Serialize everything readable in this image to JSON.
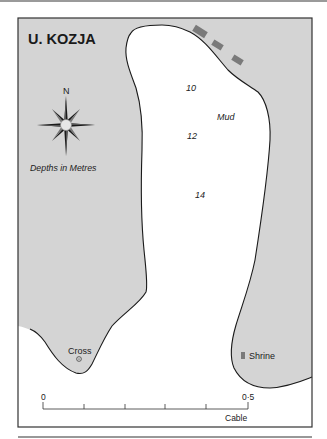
{
  "map": {
    "title": "U. KOZJA",
    "compass": {
      "north_label": "N"
    },
    "depth_note": "Depths in Metres",
    "soundings": [
      {
        "value": "10",
        "x": 186,
        "y": 91
      },
      {
        "value": "12",
        "x": 187,
        "y": 139
      },
      {
        "value": "14",
        "x": 195,
        "y": 198
      }
    ],
    "seabed": {
      "label": "Mud",
      "x": 217,
      "y": 120
    },
    "landmarks": [
      {
        "name": "Cross",
        "symbol": "⊙"
      },
      {
        "name": "Shrine"
      }
    ],
    "scale_bar": {
      "start_label": "0",
      "end_label": "0·5",
      "unit": "Cable",
      "ticks": 6
    },
    "colors": {
      "land": "#d4d4d4",
      "water": "#ffffff",
      "coastline": "#1a1a1a",
      "wall": "#7a7a7a",
      "frame": "#333333"
    }
  }
}
